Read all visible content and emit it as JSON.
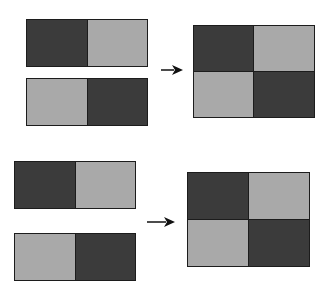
{
  "colors": {
    "dark": "#3b3b3b",
    "light": "#a9a9a9",
    "border": "#1c1c1c",
    "background": "#ffffff"
  },
  "diagrams": [
    {
      "name": "top",
      "inputs": [
        {
          "cells": [
            "dark",
            "light"
          ]
        },
        {
          "cells": [
            "light",
            "dark"
          ]
        }
      ],
      "arrow": "right-arrow",
      "output": {
        "cells": [
          "dark",
          "light",
          "light",
          "dark"
        ]
      }
    },
    {
      "name": "bottom",
      "inputs": [
        {
          "cells": [
            "dark",
            "light"
          ]
        },
        {
          "cells": [
            "light",
            "dark"
          ]
        }
      ],
      "arrow": "right-arrow",
      "output": {
        "cells": [
          "dark",
          "light",
          "light",
          "dark"
        ]
      }
    }
  ]
}
